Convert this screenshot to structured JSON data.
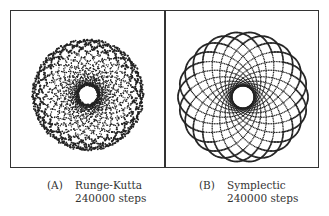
{
  "figure": {
    "panels": [
      {
        "id": "A",
        "tag": "(A)",
        "method": "Runge-Kutta",
        "steps_label": "240000 steps",
        "plot": {
          "petals": 24,
          "inner_radius": 10,
          "outer_radius": 55,
          "style": "dotted-diffuse"
        }
      },
      {
        "id": "B",
        "tag": "(B)",
        "method": "Symplectic",
        "steps_label": "240000 steps",
        "plot": {
          "petals": 22,
          "inner_radius": 11,
          "outer_radius": 65,
          "style": "dotted-crisp"
        }
      }
    ],
    "ink_color": "#222222",
    "frame_color": "#333333"
  }
}
